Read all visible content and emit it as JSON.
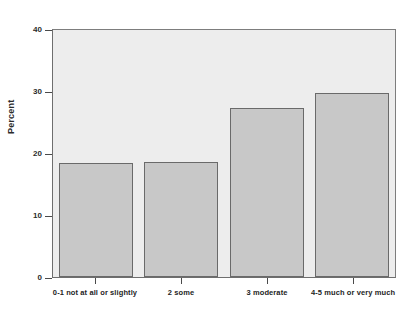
{
  "chart_data": {
    "type": "bar",
    "title": "",
    "xlabel": "",
    "ylabel": "Percent",
    "categories": [
      "0-1 not at all or slightly",
      "2 some",
      "3 moderate",
      "4-5 much or very much"
    ],
    "values": [
      19.4,
      19.5,
      28.7,
      31.3
    ],
    "ylim": [
      0,
      42
    ],
    "yticks": [
      0,
      10,
      20,
      30,
      40
    ],
    "ytick_labels": [
      "0",
      "10",
      "20",
      "30",
      "40"
    ],
    "grid": false,
    "legend": null,
    "colors": {
      "bar_fill": "#c8c8c8",
      "bar_edge": "#6a6a6a",
      "plot_background": "#ededed",
      "figure_background": "#ffffff",
      "axis": "#4a4a4a",
      "text": "#232323"
    }
  },
  "axis": {
    "y_title": "Percent"
  }
}
